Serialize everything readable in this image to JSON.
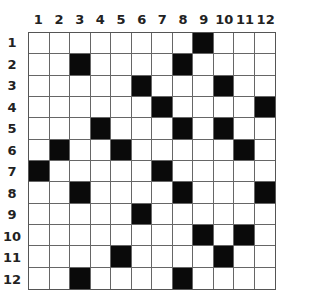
{
  "puzzle": {
    "type": "crossword-grid",
    "rows": 12,
    "cols": 12,
    "column_labels": [
      "1",
      "2",
      "3",
      "4",
      "5",
      "6",
      "7",
      "8",
      "9",
      "10",
      "11",
      "12"
    ],
    "row_labels": [
      "1",
      "2",
      "3",
      "4",
      "5",
      "6",
      "7",
      "8",
      "9",
      "10",
      "11",
      "12"
    ],
    "black_cells": [
      [
        1,
        9
      ],
      [
        2,
        3
      ],
      [
        2,
        8
      ],
      [
        3,
        6
      ],
      [
        3,
        10
      ],
      [
        4,
        7
      ],
      [
        4,
        12
      ],
      [
        5,
        4
      ],
      [
        5,
        8
      ],
      [
        5,
        10
      ],
      [
        6,
        2
      ],
      [
        6,
        5
      ],
      [
        6,
        11
      ],
      [
        7,
        1
      ],
      [
        7,
        7
      ],
      [
        8,
        3
      ],
      [
        8,
        8
      ],
      [
        8,
        12
      ],
      [
        9,
        6
      ],
      [
        10,
        9
      ],
      [
        10,
        11
      ],
      [
        11,
        5
      ],
      [
        11,
        10
      ],
      [
        12,
        3
      ],
      [
        12,
        8
      ]
    ],
    "colors": {
      "black": "#0a0a0a",
      "white": "#ffffff",
      "grid_line": "#666666"
    }
  }
}
